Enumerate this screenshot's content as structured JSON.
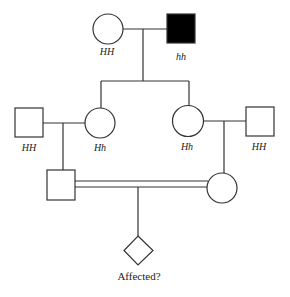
{
  "diagram": {
    "type": "pedigree",
    "colors": {
      "line": "#333333",
      "affected_fill": "#000000",
      "unaffected_fill": "#ffffff"
    },
    "individuals": [
      {
        "id": "g1_female",
        "sex": "female",
        "affected": false,
        "genotype": "HH"
      },
      {
        "id": "g1_male",
        "sex": "male",
        "affected": true,
        "genotype": "hh"
      },
      {
        "id": "g2_left_male",
        "sex": "male",
        "affected": false,
        "genotype": "HH"
      },
      {
        "id": "g2_left_female",
        "sex": "female",
        "affected": false,
        "genotype": "Hh"
      },
      {
        "id": "g2_right_female",
        "sex": "female",
        "affected": false,
        "genotype": "Hh"
      },
      {
        "id": "g2_right_male",
        "sex": "male",
        "affected": false,
        "genotype": "HH"
      },
      {
        "id": "g3_male",
        "sex": "male",
        "affected": false,
        "genotype": ""
      },
      {
        "id": "g3_female",
        "sex": "female",
        "affected": false,
        "genotype": ""
      },
      {
        "id": "g4_child",
        "sex": "unknown",
        "affected": null,
        "genotype": "",
        "label": "Affected?"
      }
    ],
    "relationships": [
      {
        "type": "mating",
        "partners": [
          "g1_female",
          "g1_male"
        ],
        "children": [
          "g2_left_female",
          "g2_right_female"
        ]
      },
      {
        "type": "mating",
        "partners": [
          "g2_left_male",
          "g2_left_female"
        ],
        "children": [
          "g3_male"
        ]
      },
      {
        "type": "mating",
        "partners": [
          "g2_right_female",
          "g2_right_male"
        ],
        "children": [
          "g3_female"
        ]
      },
      {
        "type": "consanguineous_mating",
        "partners": [
          "g3_male",
          "g3_female"
        ],
        "children": [
          "g4_child"
        ]
      }
    ],
    "labels": {
      "g1_female": "HH",
      "g1_male": "hh",
      "g2_left_male": "HH",
      "g2_left_female": "Hh",
      "g2_right_female": "Hh",
      "g2_right_male": "HH",
      "g4_child": "Affected?"
    }
  }
}
